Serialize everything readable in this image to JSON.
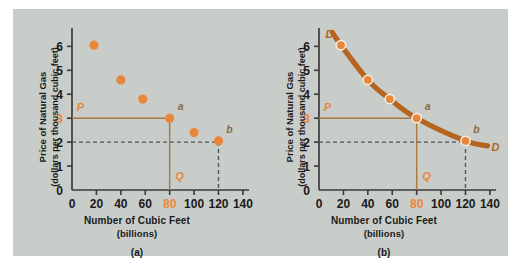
{
  "figure": {
    "background_color": "#c8cdc9",
    "accent_color": "#e8873a",
    "curve_color": "#b5651f",
    "dash_color": "#4a5560",
    "axis_color": "#3a3a3a"
  },
  "panels": [
    {
      "id": "a",
      "caption_id": "(a)",
      "caption_main": "Number of Cubic Feet",
      "caption_sub": "(billions)",
      "ylabel_line1": "Price of Natural Gas",
      "ylabel_line2": "(dollars per thousand cubic feet)",
      "annotations": {
        "price_label": "P",
        "quantity_label": "Q",
        "point_a": "a",
        "point_b": "b"
      }
    },
    {
      "id": "b",
      "caption_id": "(b)",
      "caption_main": "Number of Cubic Feet",
      "caption_sub": "(billions)",
      "ylabel_line1": "Price of Natural Gas",
      "ylabel_line2": "(dollars per thousand cubic feet)",
      "annotations": {
        "price_label": "P",
        "quantity_label": "Q",
        "point_a": "a",
        "point_b": "b",
        "curve_label_top": "D",
        "curve_label_bottom": "D"
      }
    }
  ],
  "chart_data": [
    {
      "type": "scatter",
      "title": "",
      "xlabel": "Number of Cubic Feet (billions)",
      "ylabel": "Price of Natural Gas (dollars per thousand cubic feet)",
      "xlim": [
        0,
        145
      ],
      "ylim": [
        0,
        6.6
      ],
      "xticks": [
        0,
        20,
        40,
        60,
        80,
        100,
        120,
        140
      ],
      "xticklabels": [
        "0",
        "20",
        "40",
        "60",
        "80",
        "100",
        "120",
        "140"
      ],
      "yticks": [
        0,
        1,
        2,
        3,
        4,
        5,
        6
      ],
      "yticklabels": [
        "0",
        "1",
        "2",
        "3",
        "4",
        "5",
        "6"
      ],
      "highlighted_xtick": "80",
      "highlighted_ytick": "3",
      "grid": false,
      "legend": false,
      "points": [
        {
          "x": 18,
          "y": 6.05,
          "label": ""
        },
        {
          "x": 40,
          "y": 4.6,
          "label": ""
        },
        {
          "x": 58,
          "y": 3.8,
          "label": ""
        },
        {
          "x": 80,
          "y": 3.0,
          "label": "a"
        },
        {
          "x": 100,
          "y": 2.4,
          "label": ""
        },
        {
          "x": 120,
          "y": 2.05,
          "label": "b"
        }
      ],
      "guides": [
        {
          "style": "solid",
          "price": 3.0,
          "quantity": 80,
          "price_label": "P",
          "quantity_label": "Q"
        },
        {
          "style": "dashed",
          "price": 2.0,
          "quantity": 120
        }
      ]
    },
    {
      "type": "line",
      "title": "",
      "xlabel": "Number of Cubic Feet (billions)",
      "ylabel": "Price of Natural Gas (dollars per thousand cubic feet)",
      "xlim": [
        0,
        145
      ],
      "ylim": [
        0,
        6.6
      ],
      "xticks": [
        0,
        20,
        40,
        60,
        80,
        100,
        120,
        140
      ],
      "xticklabels": [
        "0",
        "20",
        "40",
        "60",
        "80",
        "100",
        "120",
        "140"
      ],
      "yticks": [
        0,
        1,
        2,
        3,
        4,
        5,
        6
      ],
      "yticklabels": [
        "0",
        "1",
        "2",
        "3",
        "4",
        "5",
        "6"
      ],
      "highlighted_xtick": "80",
      "highlighted_ytick": "3",
      "grid": false,
      "legend": false,
      "series_name": "D",
      "points": [
        {
          "x": 18,
          "y": 6.05,
          "label": ""
        },
        {
          "x": 40,
          "y": 4.6,
          "label": ""
        },
        {
          "x": 58,
          "y": 3.8,
          "label": ""
        },
        {
          "x": 80,
          "y": 3.0,
          "label": "a"
        },
        {
          "x": 120,
          "y": 2.05,
          "label": "b"
        }
      ],
      "curve_extent": {
        "x_start": 11,
        "x_end": 138
      },
      "guides": [
        {
          "style": "solid",
          "price": 3.0,
          "quantity": 80,
          "price_label": "P",
          "quantity_label": "Q"
        },
        {
          "style": "dashed",
          "price": 2.0,
          "quantity": 120
        }
      ]
    }
  ]
}
